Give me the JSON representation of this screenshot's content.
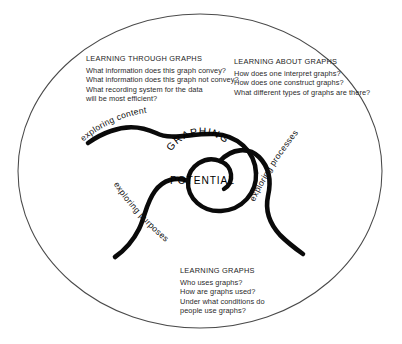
{
  "diagram": {
    "frame": {
      "shape": "ellipse",
      "stroke_color": "#4a4a4a"
    },
    "core": {
      "line1": "GRAPHING",
      "line2": "POTENTIAL",
      "color": "#000000"
    },
    "arms": [
      {
        "id": "content",
        "label": "exploring content"
      },
      {
        "id": "processes",
        "label": "exploring processes"
      },
      {
        "id": "purposes",
        "label": "exploring purposes"
      }
    ],
    "blocks": [
      {
        "id": "learning-through-graphs",
        "heading": "LEARNING THROUGH GRAPHS",
        "lines": [
          "What information does this graph convey?",
          "What information does this graph not convey?",
          "What recording system for the data",
          "will be most efficient?"
        ]
      },
      {
        "id": "learning-about-graphs",
        "heading": "LEARNING ABOUT GRAPHS",
        "lines": [
          "How does one interpret graphs?",
          "How does one construct graphs?",
          "What different types of graphs are there?"
        ]
      },
      {
        "id": "learning-graphs",
        "heading": "LEARNING GRAPHS",
        "lines": [
          "Who uses graphs?",
          "How are graphs used?",
          "Under what conditions do",
          "people use graphs?"
        ]
      }
    ]
  }
}
